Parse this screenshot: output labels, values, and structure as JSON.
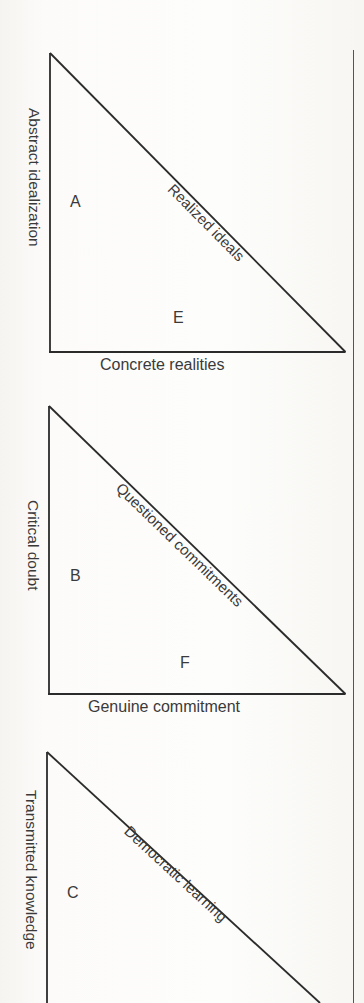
{
  "page": {
    "width": 364,
    "height": 1003,
    "background_color": "#fbfaf8",
    "ink_color": "#2b2b2b"
  },
  "right_margin_rule": {
    "name": "vertical-rule",
    "x": 353,
    "y_start": 50,
    "y_end": 1003
  },
  "diagrams": [
    {
      "id": "diagram-a",
      "y_label": "Abstract idealization",
      "x_label": "Concrete realities",
      "hypotenuse_label": "Realized ideals",
      "upper_region_letter": "A",
      "lower_region_letter": "E",
      "apex": [
        50,
        53
      ],
      "origin": [
        50,
        352
      ],
      "right": [
        345,
        352
      ]
    },
    {
      "id": "diagram-b",
      "y_label": "Critical doubt",
      "x_label": "Genuine commitment",
      "hypotenuse_label": "Questioned commitments",
      "upper_region_letter": "B",
      "lower_region_letter": "F",
      "apex": [
        49,
        406
      ],
      "origin": [
        49,
        694
      ],
      "right": [
        345,
        694
      ]
    },
    {
      "id": "diagram-c",
      "y_label": "Transmitted knowledge",
      "x_label": "",
      "hypotenuse_label": "Democratic learning",
      "upper_region_letter": "C",
      "lower_region_letter": "",
      "apex": [
        47,
        752
      ],
      "origin": [
        47,
        1003
      ],
      "right": [
        345,
        1003
      ]
    }
  ]
}
